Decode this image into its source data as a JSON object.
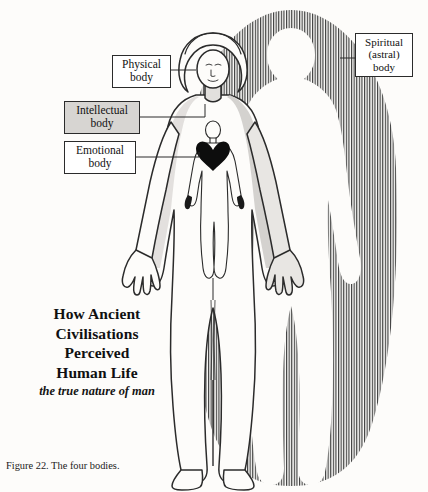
{
  "figure": {
    "caption": "Figure 22. The four bodies.",
    "background_color": "#fdfcfa",
    "ink_color": "#2b2b2b"
  },
  "title_block": {
    "lines": [
      "How Ancient",
      "Civilisations",
      "Perceived",
      "Human Life"
    ],
    "subtitle": "the true nature of man"
  },
  "labels": {
    "physical": {
      "lines": [
        "Physical",
        "body"
      ],
      "box_fill": "#ffffff"
    },
    "intellectual": {
      "lines": [
        "Intellectual",
        "body"
      ],
      "box_fill": "#d7d5d2"
    },
    "emotional": {
      "lines": [
        "Emotional",
        "body"
      ],
      "box_fill": "#ffffff"
    },
    "spiritual": {
      "lines": [
        "Spiritual",
        "(astral)",
        "body"
      ],
      "box_fill": "#ffffff"
    }
  },
  "illustration": {
    "physical_body_name": "female-figure-outline",
    "intellectual_body_name": "head-and-brain-region",
    "emotional_body_name": "inner-figure-with-heart",
    "spiritual_body_name": "radiating-aura-silhouette",
    "heart_color": "#0d0d0d",
    "aura_line_color": "#3c3c3c",
    "shading_color": "#cfcdca"
  }
}
